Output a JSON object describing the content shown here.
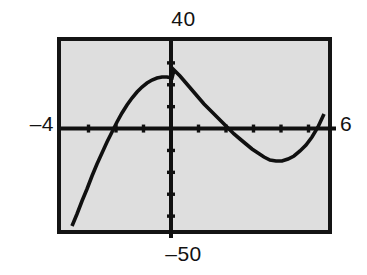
{
  "screen": {
    "label": "graphing-calculator-screen",
    "background_color": "#dedede",
    "frame_color": "#141414",
    "curve_color": "#101010",
    "axis_color": "#101010"
  },
  "labels": {
    "ymax": "40",
    "ymin": "‒50",
    "xmin": "‒4",
    "xmax": "6"
  },
  "chart_data": {
    "type": "line",
    "title": "",
    "xlabel": "",
    "ylabel": "",
    "xlim": [
      -4,
      6
    ],
    "ylim": [
      -50,
      40
    ],
    "xtick_step": 1,
    "ytick_step": 10,
    "grid": false,
    "legend": false,
    "axes_drawn": true,
    "tick_marks": true,
    "axis_range_labels": {
      "top": "40",
      "bottom": "-50",
      "left": "-4",
      "right": "6"
    },
    "features": {
      "x_intercepts": [
        -2.8,
        1.9,
        4.9
      ],
      "y_intercept": 20,
      "local_maximum": [
        -1.3,
        27
      ],
      "local_minimum": [
        3.5,
        -15
      ],
      "left_endpoint": [
        -3.6,
        -45
      ],
      "right_endpoint": [
        5.8,
        38
      ]
    },
    "series": [
      {
        "name": "curve",
        "x": [
          -3.6,
          -3.45,
          -3.3,
          -3.15,
          -3.0,
          -2.85,
          -2.7,
          -2.55,
          -2.4,
          -2.25,
          -2.1,
          -1.95,
          -1.8,
          -1.65,
          -1.5,
          -1.35,
          -1.2,
          -1.05,
          -0.9,
          -0.75,
          -0.6,
          -0.45,
          -0.3,
          -0.15,
          0.0,
          0.2,
          0.4,
          0.6,
          0.8,
          1.0,
          1.2,
          1.4,
          1.6,
          1.8,
          2.0,
          2.2,
          2.4,
          2.6,
          2.8,
          3.0,
          3.2,
          3.4,
          3.6,
          3.8,
          4.0,
          4.2,
          4.4,
          4.6,
          4.8,
          5.0,
          5.2,
          5.4,
          5.6,
          5.8
        ],
        "y": [
          -45.0,
          -38.6,
          -32.6,
          -27.0,
          -21.8,
          -17.0,
          -12.6,
          -8.6,
          -5.0,
          -1.8,
          1.0,
          3.5,
          5.6,
          7.4,
          8.9,
          10.1,
          11.0,
          11.6,
          12.0,
          12.1,
          12.0,
          11.7,
          11.2,
          10.6,
          20.0,
          17.8,
          15.5,
          13.2,
          10.8,
          8.5,
          6.2,
          4.0,
          1.9,
          -0.1,
          -2.0,
          -3.7,
          -5.2,
          -6.5,
          -7.6,
          -8.4,
          -9.0,
          -9.3,
          -9.3,
          -9.0,
          -8.4,
          -7.4,
          -6.0,
          -4.2,
          -2.0,
          0.6,
          3.7,
          7.3,
          11.4,
          16.0
        ]
      }
    ],
    "rendered_path_points": [
      [
        68,
        222
      ],
      [
        73,
        210
      ],
      [
        78,
        197
      ],
      [
        83,
        185
      ],
      [
        88,
        172
      ],
      [
        93,
        160
      ],
      [
        98,
        149
      ],
      [
        103,
        138
      ],
      [
        108,
        128
      ],
      [
        113,
        118
      ],
      [
        118,
        109
      ],
      [
        123,
        101
      ],
      [
        128,
        94
      ],
      [
        133,
        88
      ],
      [
        138,
        83
      ],
      [
        143,
        79
      ],
      [
        148,
        76
      ],
      [
        153,
        74
      ],
      [
        158,
        73
      ],
      [
        163,
        73
      ],
      [
        168,
        74
      ],
      [
        170,
        66
      ],
      [
        176,
        72
      ],
      [
        182,
        79
      ],
      [
        188,
        86
      ],
      [
        194,
        93
      ],
      [
        200,
        100
      ],
      [
        206,
        106
      ],
      [
        212,
        112
      ],
      [
        218,
        118
      ],
      [
        224,
        124
      ],
      [
        230,
        130
      ],
      [
        236,
        135
      ],
      [
        242,
        140
      ],
      [
        248,
        145
      ],
      [
        254,
        149
      ],
      [
        260,
        153
      ],
      [
        266,
        156
      ],
      [
        272,
        157
      ],
      [
        278,
        157
      ],
      [
        284,
        155
      ],
      [
        290,
        152
      ],
      [
        296,
        147
      ],
      [
        302,
        141
      ],
      [
        308,
        133
      ],
      [
        314,
        123
      ],
      [
        320,
        110
      ],
      [
        324,
        94
      ],
      [
        327,
        78
      ],
      [
        329,
        55
      ]
    ]
  }
}
